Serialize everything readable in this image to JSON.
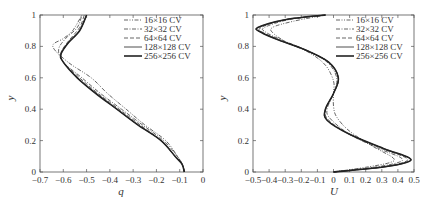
{
  "chart_data": [
    {
      "type": "line",
      "title": "",
      "xlabel": "q",
      "ylabel": "y",
      "xlim": [
        -0.7,
        0
      ],
      "ylim": [
        0,
        1
      ],
      "xticks": [
        "-0.7",
        "-0.6",
        "-0.5",
        "-0.4",
        "-0.3",
        "-0.2",
        "-0.1",
        "0"
      ],
      "yticks": [
        "0",
        "0.2",
        "0.4",
        "0.6",
        "0.8",
        "1"
      ],
      "grid": false,
      "legend_position": "upper right",
      "series": [
        {
          "name": "16×16 CV",
          "style": "dash-dot-dot",
          "points": [
            [
              -0.08,
              0
            ],
            [
              -0.09,
              0.05
            ],
            [
              -0.11,
              0.1
            ],
            [
              -0.16,
              0.2
            ],
            [
              -0.25,
              0.3
            ],
            [
              -0.33,
              0.4
            ],
            [
              -0.41,
              0.5
            ],
            [
              -0.48,
              0.6
            ],
            [
              -0.58,
              0.7
            ],
            [
              -0.645,
              0.8
            ],
            [
              -0.6,
              0.85
            ],
            [
              -0.56,
              0.9
            ],
            [
              -0.52,
              1.0
            ]
          ]
        },
        {
          "name": "32×32 CV",
          "style": "dash-dot",
          "points": [
            [
              -0.08,
              0
            ],
            [
              -0.09,
              0.05
            ],
            [
              -0.11,
              0.1
            ],
            [
              -0.17,
              0.2
            ],
            [
              -0.26,
              0.3
            ],
            [
              -0.35,
              0.4
            ],
            [
              -0.44,
              0.5
            ],
            [
              -0.52,
              0.6
            ],
            [
              -0.6,
              0.7
            ],
            [
              -0.62,
              0.78
            ],
            [
              -0.59,
              0.85
            ],
            [
              -0.54,
              0.92
            ],
            [
              -0.52,
              1.0
            ]
          ]
        },
        {
          "name": "64×64 CV",
          "style": "dashed",
          "points": [
            [
              -0.08,
              0
            ],
            [
              -0.09,
              0.05
            ],
            [
              -0.12,
              0.1
            ],
            [
              -0.18,
              0.2
            ],
            [
              -0.27,
              0.3
            ],
            [
              -0.36,
              0.4
            ],
            [
              -0.45,
              0.5
            ],
            [
              -0.53,
              0.6
            ],
            [
              -0.6,
              0.7
            ],
            [
              -0.61,
              0.76
            ],
            [
              -0.58,
              0.83
            ],
            [
              -0.53,
              0.92
            ],
            [
              -0.51,
              1.0
            ]
          ]
        },
        {
          "name": "128×128 CV",
          "style": "thin-solid",
          "points": [
            [
              -0.08,
              0
            ],
            [
              -0.09,
              0.05
            ],
            [
              -0.12,
              0.1
            ],
            [
              -0.18,
              0.2
            ],
            [
              -0.28,
              0.3
            ],
            [
              -0.37,
              0.4
            ],
            [
              -0.46,
              0.5
            ],
            [
              -0.54,
              0.6
            ],
            [
              -0.6,
              0.7
            ],
            [
              -0.61,
              0.75
            ],
            [
              -0.58,
              0.82
            ],
            [
              -0.53,
              0.9
            ],
            [
              -0.5,
              1.0
            ]
          ]
        },
        {
          "name": "256×256 CV",
          "style": "thick-solid",
          "points": [
            [
              -0.08,
              0
            ],
            [
              -0.09,
              0.05
            ],
            [
              -0.12,
              0.1
            ],
            [
              -0.18,
              0.2
            ],
            [
              -0.28,
              0.3
            ],
            [
              -0.37,
              0.4
            ],
            [
              -0.46,
              0.5
            ],
            [
              -0.54,
              0.6
            ],
            [
              -0.6,
              0.7
            ],
            [
              -0.61,
              0.75
            ],
            [
              -0.58,
              0.82
            ],
            [
              -0.53,
              0.9
            ],
            [
              -0.5,
              1.0
            ]
          ]
        }
      ]
    },
    {
      "type": "line",
      "title": "",
      "xlabel": "U",
      "ylabel": "y",
      "xlim": [
        -0.5,
        0.5
      ],
      "ylim": [
        0,
        1
      ],
      "xticks": [
        "-0.5",
        "-0.4",
        "-0.3",
        "-0.2",
        "-0.1",
        "0",
        "0.1",
        "0.2",
        "0.3",
        "0.4",
        "0.5"
      ],
      "yticks": [
        "0",
        "0.2",
        "0.4",
        "0.6",
        "0.8",
        "1"
      ],
      "grid": false,
      "legend_position": "upper right",
      "series": [
        {
          "name": "16×16 CV",
          "style": "dash-dot-dot",
          "points": [
            [
              0,
              0
            ],
            [
              0.2,
              0.03
            ],
            [
              0.35,
              0.06
            ],
            [
              0.37,
              0.09
            ],
            [
              0.25,
              0.16
            ],
            [
              0.1,
              0.26
            ],
            [
              0.02,
              0.35
            ],
            [
              0.0,
              0.42
            ],
            [
              0.0,
              0.5
            ],
            [
              0.0,
              0.58
            ],
            [
              -0.05,
              0.68
            ],
            [
              -0.15,
              0.76
            ],
            [
              -0.28,
              0.82
            ],
            [
              -0.37,
              0.88
            ],
            [
              -0.38,
              0.92
            ],
            [
              -0.25,
              0.96
            ],
            [
              -0.05,
              1.0
            ]
          ]
        },
        {
          "name": "32×32 CV",
          "style": "dash-dot",
          "points": [
            [
              0,
              0
            ],
            [
              0.25,
              0.03
            ],
            [
              0.4,
              0.06
            ],
            [
              0.42,
              0.09
            ],
            [
              0.28,
              0.15
            ],
            [
              0.1,
              0.24
            ],
            [
              -0.02,
              0.34
            ],
            [
              -0.04,
              0.4
            ],
            [
              0.0,
              0.5
            ],
            [
              0.02,
              0.6
            ],
            [
              -0.04,
              0.7
            ],
            [
              -0.18,
              0.78
            ],
            [
              -0.32,
              0.84
            ],
            [
              -0.42,
              0.89
            ],
            [
              -0.43,
              0.92
            ],
            [
              -0.28,
              0.97
            ],
            [
              -0.05,
              1.0
            ]
          ]
        },
        {
          "name": "64×64 CV",
          "style": "dashed",
          "points": [
            [
              0,
              0
            ],
            [
              0.28,
              0.03
            ],
            [
              0.43,
              0.06
            ],
            [
              0.45,
              0.09
            ],
            [
              0.3,
              0.15
            ],
            [
              0.1,
              0.24
            ],
            [
              -0.03,
              0.33
            ],
            [
              -0.05,
              0.4
            ],
            [
              0.0,
              0.5
            ],
            [
              0.03,
              0.6
            ],
            [
              -0.03,
              0.7
            ],
            [
              -0.18,
              0.78
            ],
            [
              -0.33,
              0.84
            ],
            [
              -0.44,
              0.89
            ],
            [
              -0.45,
              0.92
            ],
            [
              -0.3,
              0.97
            ],
            [
              -0.05,
              1.0
            ]
          ]
        },
        {
          "name": "128×128 CV",
          "style": "thin-solid",
          "points": [
            [
              0,
              0
            ],
            [
              0.3,
              0.03
            ],
            [
              0.45,
              0.06
            ],
            [
              0.47,
              0.09
            ],
            [
              0.31,
              0.15
            ],
            [
              0.1,
              0.24
            ],
            [
              -0.04,
              0.33
            ],
            [
              -0.05,
              0.4
            ],
            [
              0.0,
              0.5
            ],
            [
              0.03,
              0.6
            ],
            [
              -0.03,
              0.7
            ],
            [
              -0.18,
              0.78
            ],
            [
              -0.34,
              0.84
            ],
            [
              -0.45,
              0.89
            ],
            [
              -0.47,
              0.92
            ],
            [
              -0.3,
              0.97
            ],
            [
              -0.05,
              1.0
            ]
          ]
        },
        {
          "name": "256×256 CV",
          "style": "thick-solid",
          "points": [
            [
              0,
              0
            ],
            [
              0.3,
              0.03
            ],
            [
              0.45,
              0.06
            ],
            [
              0.47,
              0.09
            ],
            [
              0.31,
              0.15
            ],
            [
              0.1,
              0.24
            ],
            [
              -0.04,
              0.33
            ],
            [
              -0.05,
              0.4
            ],
            [
              0.0,
              0.5
            ],
            [
              0.03,
              0.6
            ],
            [
              -0.03,
              0.7
            ],
            [
              -0.18,
              0.78
            ],
            [
              -0.34,
              0.84
            ],
            [
              -0.45,
              0.89
            ],
            [
              -0.47,
              0.92
            ],
            [
              -0.3,
              0.97
            ],
            [
              -0.05,
              1.0
            ]
          ]
        }
      ]
    }
  ],
  "left_plot": {
    "xlabel": "q",
    "ylabel": "y",
    "xticks": [
      "-0.7",
      "-0.6",
      "-0.5",
      "-0.4",
      "-0.3",
      "-0.2",
      "-0.1",
      "0"
    ],
    "yticks": [
      "0",
      "0.2",
      "0.4",
      "0.6",
      "0.8",
      "1"
    ],
    "legend": [
      "16×16 CV",
      "32×32 CV",
      "64×64 CV",
      "128×128 CV",
      "256×256 CV"
    ]
  },
  "right_plot": {
    "xlabel": "U",
    "ylabel": "y",
    "xticks": [
      "-0.5",
      "-0.4",
      "-0.3",
      "-0.2",
      "-0.1",
      "0",
      "0.1",
      "0.2",
      "0.3",
      "0.4",
      "0.5"
    ],
    "yticks": [
      "0",
      "0.2",
      "0.4",
      "0.6",
      "0.8",
      "1"
    ],
    "legend": [
      "16×16 CV",
      "32×32 CV",
      "64×64 CV",
      "128×128 CV",
      "256×256 CV"
    ]
  }
}
